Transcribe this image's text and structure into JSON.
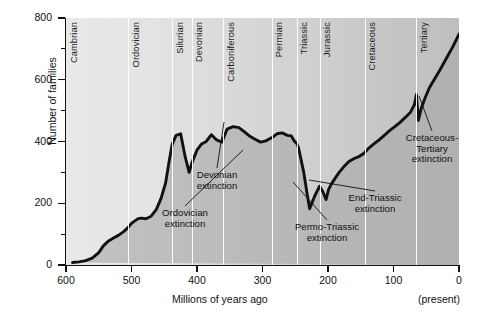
{
  "chart_data": {
    "type": "area",
    "title": "",
    "xlabel": "Millions of years ago",
    "ylabel": "Number of families",
    "xlim": [
      600,
      0
    ],
    "ylim": [
      0,
      800
    ],
    "x_reversed": true,
    "grid": false,
    "legend": "none",
    "x_ticks": [
      600,
      500,
      400,
      300,
      200,
      100,
      0
    ],
    "y_ticks": [
      0,
      200,
      400,
      600,
      800
    ],
    "y_minor_ticks": [
      100,
      300,
      500,
      700
    ],
    "x_axis_note": "(present)",
    "series": [
      {
        "name": "Number of marine families",
        "x": [
          590,
          580,
          570,
          560,
          550,
          543,
          535,
          527,
          520,
          512,
          505,
          500,
          495,
          490,
          485,
          478,
          470,
          462,
          455,
          448,
          443,
          438,
          432,
          425,
          418,
          412,
          408,
          400,
          393,
          386,
          378,
          370,
          362,
          354,
          345,
          336,
          328,
          320,
          312,
          303,
          295,
          286,
          278,
          270,
          262,
          256,
          251,
          248,
          245,
          242,
          237,
          232,
          228,
          220,
          213,
          208,
          203,
          199,
          195,
          190,
          183,
          176,
          168,
          160,
          152,
          145,
          138,
          130,
          122,
          114,
          106,
          98,
          90,
          82,
          74,
          68,
          65,
          62,
          58,
          52,
          45,
          38,
          30,
          23,
          16,
          10,
          5,
          0
        ],
        "y": [
          8,
          10,
          14,
          22,
          40,
          62,
          78,
          88,
          96,
          108,
          122,
          135,
          143,
          150,
          152,
          150,
          158,
          180,
          215,
          265,
          330,
          390,
          420,
          425,
          350,
          300,
          330,
          372,
          392,
          400,
          422,
          405,
          398,
          440,
          448,
          445,
          432,
          418,
          408,
          398,
          402,
          412,
          425,
          428,
          420,
          418,
          400,
          395,
          380,
          350,
          300,
          232,
          182,
          225,
          255,
          238,
          212,
          245,
          262,
          278,
          300,
          318,
          335,
          345,
          352,
          362,
          378,
          392,
          405,
          420,
          435,
          448,
          462,
          478,
          495,
          520,
          552,
          468,
          505,
          540,
          575,
          600,
          628,
          655,
          682,
          705,
          726,
          748
        ]
      }
    ],
    "periods": [
      {
        "name": "Cambrian",
        "start": 600,
        "end": 505
      },
      {
        "name": "Ordovician",
        "start": 505,
        "end": 438
      },
      {
        "name": "Silurian",
        "start": 438,
        "end": 408
      },
      {
        "name": "Devonian",
        "start": 408,
        "end": 360
      },
      {
        "name": "Carboniferous",
        "start": 360,
        "end": 286
      },
      {
        "name": "Permian",
        "start": 286,
        "end": 248
      },
      {
        "name": "Triassic",
        "start": 248,
        "end": 213
      },
      {
        "name": "Jurassic",
        "start": 213,
        "end": 144
      },
      {
        "name": "Cretaceous",
        "start": 144,
        "end": 65
      },
      {
        "name": "Tertiary",
        "start": 65,
        "end": 0
      }
    ],
    "annotations": [
      {
        "name": "ordovician-extinction",
        "text": "Ordovician\nextinction",
        "label_x": 185,
        "label_y": 208,
        "point_x": 243,
        "point_y": 150
      },
      {
        "name": "devonian-extinction",
        "text": "Devonian\nextinction",
        "label_x": 217,
        "label_y": 170,
        "point_x": 224,
        "point_y": 122
      },
      {
        "name": "permo-triassic-extinction",
        "text": "Permo-Triassic\nextinction",
        "label_x": 327,
        "label_y": 222,
        "point_x": 293,
        "point_y": 182
      },
      {
        "name": "end-triassic-extinction",
        "text": "End-Triassic\nextinction",
        "label_x": 375,
        "label_y": 193,
        "point_x": 309,
        "point_y": 180
      },
      {
        "name": "cretaceous-tertiary-extinction",
        "text": "Cretaceous-\nTertiary\nextinction",
        "label_x": 432,
        "label_y": 133,
        "point_x": 419,
        "point_y": 96
      }
    ]
  },
  "colors": {
    "curve": "#111111",
    "fill": "#a8a8a8",
    "bg_left": "#e9e9e9",
    "bg_right": "#bebebe",
    "divider": "#ffffff",
    "axis": "#111111",
    "text": "#101010"
  }
}
